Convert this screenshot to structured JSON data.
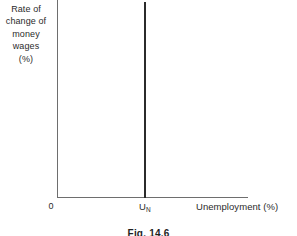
{
  "figure": {
    "caption": "Fig. 14.6",
    "background_color": "#ffffff",
    "axis_color": "#6e6e6e",
    "curve_color": "#2b2b2b",
    "text_color": "#2b2b2b"
  },
  "axes": {
    "y_label_lines": [
      "Rate of",
      "change of",
      "money",
      "wages",
      "(%)"
    ],
    "y_label_full": "Rate of change of money wages (%)",
    "x_label": "Unemployment (%)",
    "origin_label": "0"
  },
  "markers": {
    "natural_rate_symbol": "U",
    "natural_rate_subscript": "N",
    "natural_rate_full": "UN"
  },
  "chart_data": {
    "type": "line",
    "title": "Fig. 14.6",
    "xlabel": "Unemployment (%)",
    "ylabel": "Rate of change of money wages (%)",
    "xlim": [
      0,
      100
    ],
    "ylim": [
      0,
      100
    ],
    "grid": false,
    "legend": "none",
    "series": [
      {
        "name": "Long-run Phillips curve",
        "description": "Vertical line at the natural rate of unemployment UN",
        "x": [
          45.5,
          45.5
        ],
        "y": [
          0,
          100
        ]
      }
    ],
    "annotations": [
      {
        "text": "0",
        "x": 0,
        "y": 0,
        "position": "below-left of origin"
      },
      {
        "text": "UN",
        "x": 45.5,
        "y": 0,
        "position": "below x-axis at curve"
      },
      {
        "text": "Unemployment (%)",
        "x": 73,
        "y": 0,
        "position": "below x-axis right"
      }
    ]
  }
}
